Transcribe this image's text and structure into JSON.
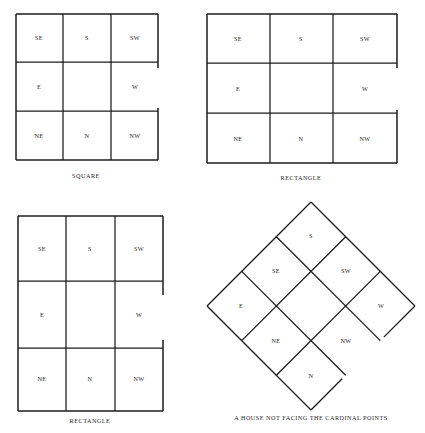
{
  "figure": {
    "ink_color": "#1c1c1c",
    "background_color": "#ffffff"
  },
  "direction_labels": {
    "south_east": "SE",
    "south": "S",
    "south_west": "SW",
    "east": "E",
    "center": "",
    "west": "W",
    "north_east": "NE",
    "north": "N",
    "north_west": "NW"
  },
  "panels": [
    {
      "id": "square",
      "caption": "SQUARE",
      "shape": "square",
      "rows": [
        [
          "SE",
          "S",
          "SW"
        ],
        [
          "E",
          "",
          "W"
        ],
        [
          "NE",
          "N",
          "NW"
        ]
      ],
      "opening": "right-middle"
    },
    {
      "id": "rectangle-1",
      "caption": "RECTANGLE",
      "shape": "rectangle-wide",
      "rows": [
        [
          "SE",
          "S",
          "SW"
        ],
        [
          "E",
          "",
          "W"
        ],
        [
          "NE",
          "N",
          "NW"
        ]
      ],
      "opening": "right-middle"
    },
    {
      "id": "rectangle-2",
      "caption": "RECTANGLE",
      "shape": "rectangle-tall",
      "rows": [
        [
          "SE",
          "S",
          "SW"
        ],
        [
          "E",
          "",
          "W"
        ],
        [
          "NE",
          "N",
          "NW"
        ]
      ],
      "opening": "right-middle"
    },
    {
      "id": "diamond",
      "caption": "A HOUSE NOT FACING THE CARDINAL POINTS",
      "shape": "rotated-square",
      "rotation_degrees": 45,
      "rows": [
        [
          "SE",
          "S",
          "SW"
        ],
        [
          "E",
          "",
          "W"
        ],
        [
          "NE",
          "N",
          "NW"
        ]
      ],
      "opening": "right-middle"
    }
  ]
}
